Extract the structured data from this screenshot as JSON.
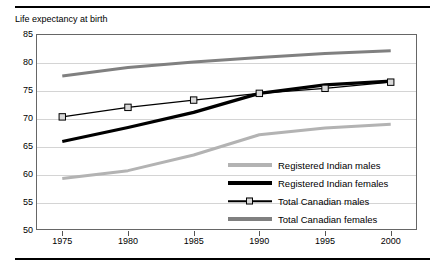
{
  "chart_data": {
    "type": "line",
    "title": "Life expectancy at birth",
    "xlabel": "",
    "ylabel": "",
    "x": [
      1975,
      1980,
      1985,
      1990,
      1995,
      2000
    ],
    "xlim": [
      1973,
      2002
    ],
    "ylim": [
      50,
      85
    ],
    "yticks": [
      50,
      55,
      60,
      65,
      70,
      75,
      80,
      85
    ],
    "xticks": [
      "1975",
      "1980",
      "1985",
      "1990",
      "1995",
      "2000"
    ],
    "grid": "horizontal",
    "legend_position": "inside-bottom-right",
    "series": [
      {
        "name": "Registered Indian males",
        "color": "#b3b3b3",
        "marker": "none",
        "width": 3,
        "values": [
          59.2,
          60.6,
          63.4,
          67.0,
          68.2,
          68.9
        ]
      },
      {
        "name": "Registered Indian females",
        "color": "#000000",
        "marker": "none",
        "width": 3.2,
        "values": [
          65.8,
          68.3,
          71.0,
          74.4,
          75.9,
          76.6
        ]
      },
      {
        "name": "Total Canadian males",
        "color": "#000000",
        "marker": "square",
        "width": 1.2,
        "values": [
          70.2,
          71.9,
          73.2,
          74.4,
          75.3,
          76.4
        ]
      },
      {
        "name": "Total Canadian females",
        "color": "#808080",
        "marker": "none",
        "width": 3,
        "values": [
          77.5,
          79.0,
          80.0,
          80.8,
          81.5,
          82.0
        ]
      }
    ]
  },
  "colors": {
    "grid": "#d4d4d4",
    "frame": "#666666",
    "rule": "#000000"
  }
}
